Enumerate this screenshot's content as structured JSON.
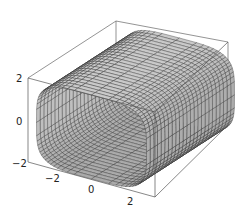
{
  "chart_data": {
    "type": "surface3d",
    "title": "",
    "xlabel": "",
    "ylabel": "",
    "zlabel": "",
    "x_ticks": [
      "-2",
      "0",
      "2"
    ],
    "z_ticks": [
      "2",
      "0",
      "-2"
    ],
    "xlim": [
      -3,
      3
    ],
    "ylim": [
      -3,
      3
    ],
    "zlim": [
      -2,
      2
    ],
    "surface": {
      "shape": "rounded-square tube (superellipse cross-section)",
      "axis": "y (depth)",
      "cross_section_half_width": 2,
      "cross_section_half_height": 2,
      "length_range": [
        -3,
        3
      ]
    },
    "colors": {
      "face": "#b8b8b8",
      "mesh_lines": "#222222",
      "box": "#555555"
    },
    "grid": false,
    "legend": null
  }
}
